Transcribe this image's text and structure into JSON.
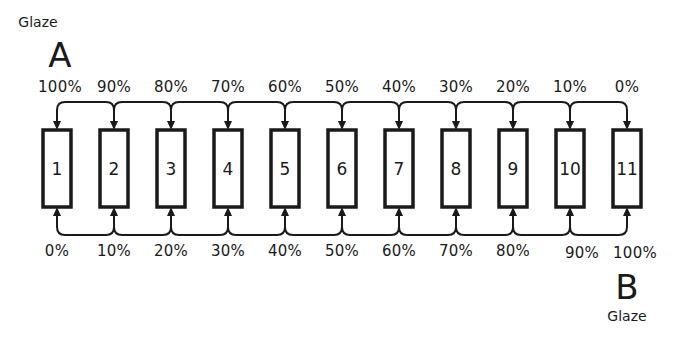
{
  "diagram": {
    "type": "countercurrent-flow",
    "colors": {
      "line": "#1a1a1a",
      "background": "#ffffff"
    },
    "glaze_a": {
      "word": "Glaze",
      "letter": "A"
    },
    "glaze_b": {
      "word": "Glaze",
      "letter": "B"
    },
    "vessels": [
      {
        "label": "1",
        "top_pct": "100%",
        "bottom_pct": "0%"
      },
      {
        "label": "2",
        "top_pct": "90%",
        "bottom_pct": "10%"
      },
      {
        "label": "3",
        "top_pct": "80%",
        "bottom_pct": "20%"
      },
      {
        "label": "4",
        "top_pct": "70%",
        "bottom_pct": "30%"
      },
      {
        "label": "5",
        "top_pct": "60%",
        "bottom_pct": "40%"
      },
      {
        "label": "6",
        "top_pct": "50%",
        "bottom_pct": "50%"
      },
      {
        "label": "7",
        "top_pct": "40%",
        "bottom_pct": "60%"
      },
      {
        "label": "8",
        "top_pct": "30%",
        "bottom_pct": "70%"
      },
      {
        "label": "9",
        "top_pct": "20%",
        "bottom_pct": "80%"
      },
      {
        "label": "10",
        "top_pct": "10%",
        "bottom_pct": "90%"
      },
      {
        "label": "11",
        "top_pct": "0%",
        "bottom_pct": "100%"
      }
    ]
  }
}
